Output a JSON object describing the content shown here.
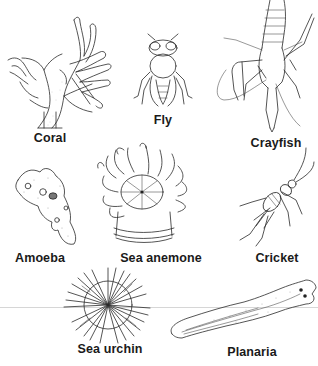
{
  "figure": {
    "organisms": [
      {
        "name": "Coral",
        "label_x": 50,
        "label_y": 131
      },
      {
        "name": "Fly",
        "label_x": 163,
        "label_y": 113
      },
      {
        "name": "Crayfish",
        "label_x": 276,
        "label_y": 136
      },
      {
        "name": "Amoeba",
        "label_x": 40,
        "label_y": 251
      },
      {
        "name": "Sea anemone",
        "label_x": 161,
        "label_y": 251
      },
      {
        "name": "Cricket",
        "label_x": 277,
        "label_y": 251
      },
      {
        "name": "Sea urchin",
        "label_x": 110,
        "label_y": 342
      },
      {
        "name": "Planaria",
        "label_x": 252,
        "label_y": 345
      }
    ],
    "colors": {
      "background": "#ffffff",
      "ink": "#2a2a2a",
      "label": "#1a1a1a",
      "divider": "#d6d6d6"
    }
  }
}
